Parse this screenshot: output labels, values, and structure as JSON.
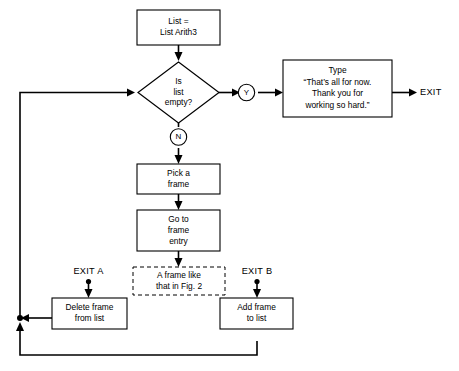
{
  "diagram": {
    "background_color": "#ffffff",
    "line_color": "#000000"
  },
  "nodes": {
    "start_box": {
      "shape": "process",
      "lines": [
        "List =",
        "List Arith3"
      ]
    },
    "decision": {
      "shape": "decision",
      "lines": [
        "Is",
        "list",
        "empty?"
      ]
    },
    "branch_yes": {
      "shape": "connector-circle",
      "label": "Y"
    },
    "branch_no": {
      "shape": "connector-circle",
      "label": "N"
    },
    "type_box": {
      "shape": "process",
      "lines": [
        "Type",
        "“That’s all for now.",
        "Thank you for",
        "working so hard.”"
      ]
    },
    "exit_terminal": {
      "shape": "label",
      "label": "EXIT"
    },
    "pick_frame": {
      "shape": "process",
      "lines": [
        "Pick a",
        "frame"
      ]
    },
    "go_to_frame_entry": {
      "shape": "process",
      "lines": [
        "Go to",
        "frame",
        "entry"
      ]
    },
    "frame_like_fig2": {
      "shape": "process-dashed",
      "lines": [
        "A frame like",
        "that in Fig. 2"
      ]
    },
    "exit_a": {
      "shape": "label",
      "label": "EXIT A"
    },
    "exit_b": {
      "shape": "label",
      "label": "EXIT B"
    },
    "delete_frame": {
      "shape": "process",
      "lines": [
        "Delete frame",
        "from list"
      ]
    },
    "add_frame": {
      "shape": "process",
      "lines": [
        "Add frame",
        "to list"
      ]
    }
  }
}
